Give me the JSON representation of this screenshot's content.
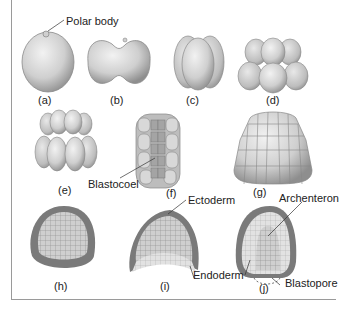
{
  "figure": {
    "panels": [
      {
        "id": "a",
        "caption": "(a)",
        "stage": "zygote with polar body"
      },
      {
        "id": "b",
        "caption": "(b)",
        "stage": "2-cell"
      },
      {
        "id": "c",
        "caption": "(c)",
        "stage": "4-cell"
      },
      {
        "id": "d",
        "caption": "(d)",
        "stage": "8-cell"
      },
      {
        "id": "e",
        "caption": "(e)",
        "stage": "16-cell"
      },
      {
        "id": "f",
        "caption": "(f)",
        "stage": "cut-away blastula"
      },
      {
        "id": "g",
        "caption": "(g)",
        "stage": "blastula"
      },
      {
        "id": "h",
        "caption": "(h)",
        "stage": "blastula section"
      },
      {
        "id": "i",
        "caption": "(i)",
        "stage": "early gastrula"
      },
      {
        "id": "j",
        "caption": "(j)",
        "stage": "gastrula"
      }
    ],
    "labels": {
      "polar_body": "Polar body",
      "blastocoel": "Blastocoel",
      "ectoderm": "Ectoderm",
      "archenteron": "Archenteron",
      "endoderm": "Endoderm",
      "blastopore": "Blastopore"
    },
    "colors": {
      "cell_fill": "#d4d4d4",
      "cell_shadow": "#9a9a9a",
      "ectoderm": "#7a7a7a",
      "endoderm": "#d8d8d8",
      "line": "#333333"
    }
  }
}
